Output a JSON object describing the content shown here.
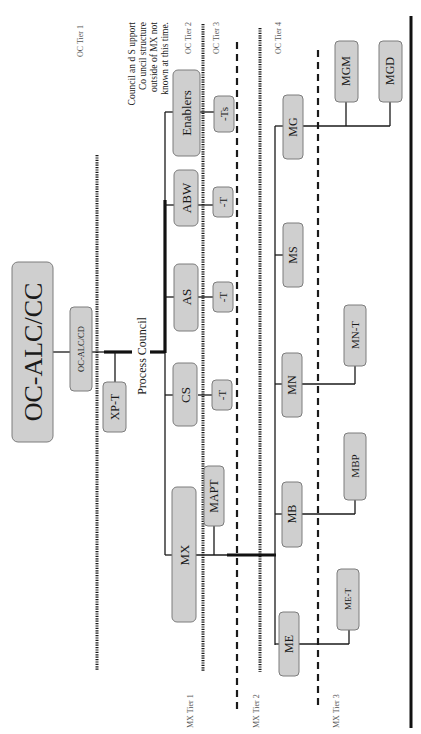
{
  "diagram": {
    "title_node": "OC-ALC/CC",
    "deputy_node": "OC-ALC/CD",
    "xp_team": "XP-T",
    "process_council_label": "Process Council",
    "note": [
      "Council an d S upport",
      "Co uncil structure",
      "outside of MX not",
      "known at  this time."
    ],
    "oc_tiers": [
      "OC Tier  1",
      "OC Tier 2",
      "OC Tier 3",
      "OC Tier  4"
    ],
    "mx_tiers": [
      "MX Tier  1",
      "MX Tier  2",
      "MX Tier  3"
    ],
    "council_nodes": [
      {
        "id": "enablers",
        "label": "Enablers",
        "team": "-Ts"
      },
      {
        "id": "abw",
        "label": "ABW",
        "team": "-T"
      },
      {
        "id": "as",
        "label": "AS",
        "team": "-T"
      },
      {
        "id": "cs",
        "label": "CS",
        "team": "-T"
      },
      {
        "id": "mx",
        "label": "MX",
        "team": "MAPT"
      }
    ],
    "mx_nodes": [
      {
        "id": "mg",
        "label": "MG",
        "children": [
          "MGM",
          "MGD"
        ]
      },
      {
        "id": "ms",
        "label": "MS",
        "children": []
      },
      {
        "id": "mn",
        "label": "MN",
        "children": [
          "MN-T"
        ]
      },
      {
        "id": "mb",
        "label": "MB",
        "children": [
          "MBP"
        ]
      },
      {
        "id": "me",
        "label": "ME",
        "children": [
          "ME-T"
        ]
      }
    ]
  }
}
